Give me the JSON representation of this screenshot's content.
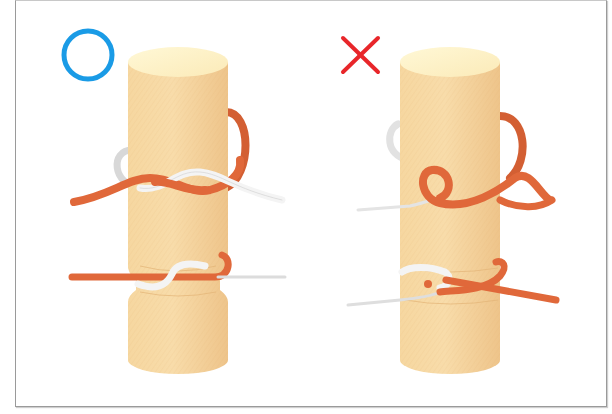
{
  "figure": {
    "panels": [
      {
        "id": "correct",
        "mark": "circle",
        "mark_meaning": "correct",
        "mark_symbol": "○",
        "mark_color": "#1a9be6"
      },
      {
        "id": "incorrect",
        "mark": "cross",
        "mark_meaning": "incorrect",
        "mark_symbol": "×",
        "mark_color": "#e8262a"
      }
    ],
    "colors": {
      "post_body": "#f3cf94",
      "post_top": "#fdf2c6",
      "rope_orange": "#e0683a",
      "rope_white": "#f2f2f2",
      "frame_border": "#9a9a9a"
    }
  }
}
